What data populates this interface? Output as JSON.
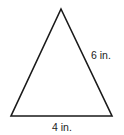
{
  "figure": {
    "shape": "isosceles triangle",
    "side_label": "6 in.",
    "base_label": "4 in.",
    "stroke_color": "#1a1a1a",
    "text_color": "#222222"
  }
}
